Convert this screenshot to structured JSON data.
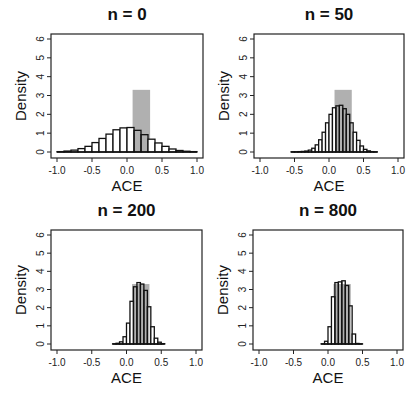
{
  "chart_data": [
    {
      "type": "bar",
      "title": "n = 0",
      "xlabel": "ACE",
      "ylabel": "Density",
      "xlim": [
        -1.0,
        1.0
      ],
      "ylim": [
        0,
        6
      ],
      "xticks": [
        "-1.0",
        "-0.5",
        "0.0",
        "0.5",
        "1.0"
      ],
      "yticks": [
        "0",
        "1",
        "2",
        "3",
        "4",
        "5",
        "6"
      ],
      "grid": false,
      "reference_band": {
        "x_from": 0.08,
        "x_to": 0.33,
        "height": 3.3,
        "color": "#b0b0b0"
      },
      "bin_width": 0.1,
      "bin_starts": [
        -1.0,
        -0.9,
        -0.8,
        -0.7,
        -0.6,
        -0.5,
        -0.4,
        -0.3,
        -0.2,
        -0.1,
        0.0,
        0.1,
        0.2,
        0.3,
        0.4,
        0.5,
        0.6,
        0.7,
        0.8,
        0.9
      ],
      "values": [
        0.02,
        0.05,
        0.1,
        0.18,
        0.3,
        0.5,
        0.72,
        0.95,
        1.18,
        1.28,
        1.3,
        1.15,
        0.92,
        0.68,
        0.48,
        0.3,
        0.16,
        0.08,
        0.04,
        0.02
      ]
    },
    {
      "type": "bar",
      "title": "n = 50",
      "xlabel": "ACE",
      "ylabel": "Density",
      "xlim": [
        -1.0,
        1.0
      ],
      "ylim": [
        0,
        6
      ],
      "xticks": [
        "-1.0",
        "-0.5",
        "0.0",
        "0.5",
        "1.0"
      ],
      "yticks": [
        "0",
        "1",
        "2",
        "3",
        "4",
        "5",
        "6"
      ],
      "grid": false,
      "reference_band": {
        "x_from": 0.08,
        "x_to": 0.33,
        "height": 3.3,
        "color": "#b0b0b0"
      },
      "bin_width": 0.05,
      "bin_starts": [
        -0.55,
        -0.5,
        -0.45,
        -0.4,
        -0.35,
        -0.3,
        -0.25,
        -0.2,
        -0.15,
        -0.1,
        -0.05,
        0.0,
        0.05,
        0.1,
        0.15,
        0.2,
        0.25,
        0.3,
        0.35,
        0.4,
        0.45,
        0.5,
        0.55,
        0.6,
        0.65
      ],
      "values": [
        0.01,
        0.01,
        0.02,
        0.03,
        0.05,
        0.1,
        0.2,
        0.38,
        0.65,
        1.05,
        1.55,
        2.0,
        2.35,
        2.45,
        2.48,
        2.3,
        2.0,
        1.55,
        1.05,
        0.62,
        0.32,
        0.14,
        0.06,
        0.02,
        0.01
      ]
    },
    {
      "type": "bar",
      "title": "n = 200",
      "xlabel": "ACE",
      "ylabel": "Density",
      "xlim": [
        -1.0,
        1.0
      ],
      "ylim": [
        0,
        6
      ],
      "xticks": [
        "-1.0",
        "-0.5",
        "0.0",
        "0.5",
        "1.0"
      ],
      "yticks": [
        "0",
        "1",
        "2",
        "3",
        "4",
        "5",
        "6"
      ],
      "grid": false,
      "reference_band": {
        "x_from": 0.08,
        "x_to": 0.33,
        "height": 3.3,
        "color": "#b0b0b0"
      },
      "bin_width": 0.05,
      "bin_starts": [
        -0.2,
        -0.15,
        -0.1,
        -0.05,
        0.0,
        0.05,
        0.1,
        0.15,
        0.2,
        0.25,
        0.3,
        0.35,
        0.4,
        0.45,
        0.5
      ],
      "values": [
        0.01,
        0.04,
        0.12,
        0.4,
        1.15,
        2.35,
        3.15,
        3.38,
        3.3,
        2.95,
        2.05,
        0.95,
        0.32,
        0.1,
        0.02
      ]
    },
    {
      "type": "bar",
      "title": "n = 800",
      "xlabel": "ACE",
      "ylabel": "Density",
      "xlim": [
        -1.0,
        1.0
      ],
      "ylim": [
        0,
        6
      ],
      "xticks": [
        "-1.0",
        "-0.5",
        "0.0",
        "0.5",
        "1.0"
      ],
      "yticks": [
        "0",
        "1",
        "2",
        "3",
        "4",
        "5",
        "6"
      ],
      "grid": false,
      "reference_band": {
        "x_from": 0.08,
        "x_to": 0.33,
        "height": 3.3,
        "color": "#b0b0b0"
      },
      "bin_width": 0.05,
      "bin_starts": [
        -0.1,
        -0.05,
        0.0,
        0.05,
        0.1,
        0.15,
        0.2,
        0.25,
        0.3,
        0.35,
        0.4,
        0.45
      ],
      "values": [
        0.01,
        0.15,
        0.95,
        2.6,
        3.38,
        3.42,
        3.48,
        3.22,
        2.1,
        0.55,
        0.03,
        0.01
      ]
    }
  ]
}
